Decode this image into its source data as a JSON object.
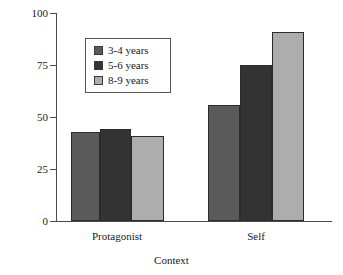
{
  "chart_data": {
    "type": "bar",
    "title": "",
    "subtitle": "",
    "xlabel": "Context",
    "ylabel": "",
    "categories": [
      "Protagonist",
      "Self"
    ],
    "ylim": [
      0,
      100
    ],
    "yticks": [
      0,
      25,
      50,
      75,
      100
    ],
    "ytick_labels": [
      "0",
      "25",
      "50",
      "75",
      "100"
    ],
    "grid": false,
    "legend_position": "upper-left-inside",
    "series": [
      {
        "name": "3-4 years",
        "values": [
          43,
          56
        ],
        "color": "#5a5a5a"
      },
      {
        "name": "5-6 years",
        "values": [
          44,
          75
        ],
        "color": "#333333"
      },
      {
        "name": "8-9 years",
        "values": [
          41,
          91
        ],
        "color": "#adadad"
      }
    ]
  },
  "legend": {
    "entries": [
      {
        "label": "3-4 years",
        "color": "#5a5a5a"
      },
      {
        "label": "5-6 years",
        "color": "#333333"
      },
      {
        "label": "8-9 years",
        "color": "#adadad"
      }
    ]
  },
  "axis": {
    "x_label": "Context",
    "y_tick_labels": [
      "100",
      "75",
      "50",
      "25",
      "0"
    ],
    "category_labels": [
      "Protagonist",
      "Self"
    ]
  }
}
